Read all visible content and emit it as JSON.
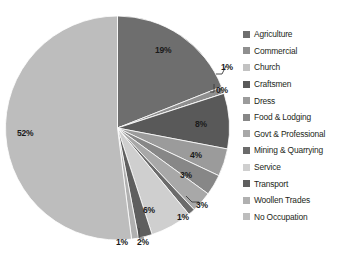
{
  "chart_data": {
    "type": "pie",
    "title": "",
    "legend_position": "right",
    "grid": false,
    "value_unit": "percent",
    "labels_show_percent": true,
    "categories": [
      "Agriculture",
      "Commercial",
      "Church",
      "Craftsmen",
      "Dress",
      "Food & Lodging",
      "Govt & Professional",
      "Mining & Quarrying",
      "Service",
      "Transport",
      "Woollen Trades",
      "No Occupation"
    ],
    "values": [
      19,
      1,
      0,
      8,
      4,
      3,
      3,
      1,
      6,
      2,
      1,
      52
    ],
    "data_labels": [
      "19%",
      "1%",
      "0%",
      "8%",
      "4%",
      "3%",
      "3%",
      "1%",
      "6%",
      "2%",
      "1%",
      "52%"
    ],
    "colors": [
      "#6e6e6e",
      "#8f8f8f",
      "#c2c2c2",
      "#595959",
      "#9b9b9b",
      "#878787",
      "#a8a8a8",
      "#6b6b6b",
      "#cfcfcf",
      "#5f5f5f",
      "#b0b0b0",
      "#bdbdbd"
    ]
  },
  "legend": {
    "items": [
      {
        "label": "Agriculture",
        "color": "#6e6e6e"
      },
      {
        "label": "Commercial",
        "color": "#8f8f8f"
      },
      {
        "label": "Church",
        "color": "#c2c2c2"
      },
      {
        "label": "Craftsmen",
        "color": "#595959"
      },
      {
        "label": "Dress",
        "color": "#9b9b9b"
      },
      {
        "label": "Food & Lodging",
        "color": "#878787"
      },
      {
        "label": "Govt & Professional",
        "color": "#a8a8a8"
      },
      {
        "label": "Mining & Quarrying",
        "color": "#6b6b6b"
      },
      {
        "label": "Service",
        "color": "#cfcfcf"
      },
      {
        "label": "Transport",
        "color": "#5f5f5f"
      },
      {
        "label": "Woollen Trades",
        "color": "#b0b0b0"
      },
      {
        "label": "No Occupation",
        "color": "#bdbdbd"
      }
    ]
  },
  "slice_labels": [
    {
      "text": "19%",
      "x": 155,
      "y": 45,
      "name": "slice-label-agriculture"
    },
    {
      "text": "1%",
      "x": 221,
      "y": 62,
      "name": "slice-label-commercial"
    },
    {
      "text": "0%",
      "x": 216,
      "y": 85,
      "name": "slice-label-church"
    },
    {
      "text": "8%",
      "x": 195,
      "y": 119,
      "name": "slice-label-craftsmen"
    },
    {
      "text": "4%",
      "x": 190,
      "y": 150,
      "name": "slice-label-dress"
    },
    {
      "text": "3%",
      "x": 180,
      "y": 170,
      "name": "slice-label-food-lodging"
    },
    {
      "text": "3%",
      "x": 196,
      "y": 200,
      "name": "slice-label-govt-professional"
    },
    {
      "text": "1%",
      "x": 177,
      "y": 212,
      "name": "slice-label-mining-quarrying"
    },
    {
      "text": "6%",
      "x": 143,
      "y": 205,
      "name": "slice-label-service"
    },
    {
      "text": "2%",
      "x": 137,
      "y": 237,
      "name": "slice-label-transport"
    },
    {
      "text": "1%",
      "x": 116,
      "y": 237,
      "name": "slice-label-woollen-trades"
    },
    {
      "text": "52%",
      "x": 17,
      "y": 128,
      "name": "slice-label-no-occupation"
    }
  ]
}
